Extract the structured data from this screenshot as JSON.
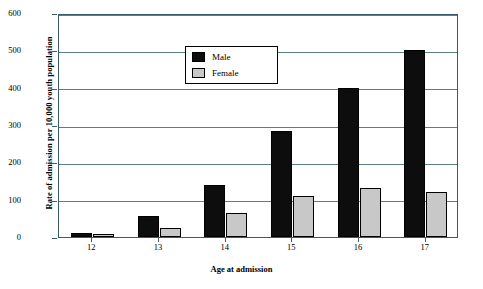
{
  "chart_data": {
    "type": "bar",
    "title": "",
    "xlabel": "Age at admission",
    "ylabel": "Rate of admission per 10,000 youth population",
    "categories": [
      "12",
      "13",
      "14",
      "15",
      "16",
      "17"
    ],
    "series": [
      {
        "name": "Male",
        "values": [
          12,
          55,
          140,
          283,
          398,
          502
        ]
      },
      {
        "name": "Female",
        "values": [
          7,
          25,
          65,
          110,
          130,
          120
        ]
      }
    ],
    "ylim": [
      0,
      600
    ],
    "yticks": [
      "0",
      "100",
      "200",
      "300",
      "400",
      "500",
      "600"
    ],
    "grid": true,
    "legend_position": "upper-center",
    "colors": {
      "male": "#0d0d0d",
      "female": "#c8c8c8",
      "axis": "#3b5c6e"
    }
  },
  "legend": {
    "male_label": "Male",
    "female_label": "Female"
  }
}
